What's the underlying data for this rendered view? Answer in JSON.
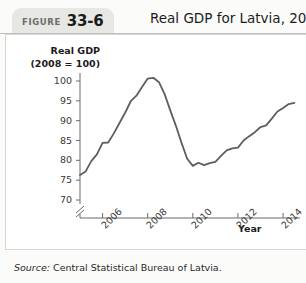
{
  "header": {
    "figure_word": "FIGURE",
    "figure_number": "33-6",
    "title": "Real GDP for Latvia, 2005–2014"
  },
  "source": {
    "label": "Source:",
    "text": "Central Statistical Bureau of Latvia."
  },
  "colors": {
    "line": "#5e5e5e",
    "axis": "#6b6b6b",
    "tab_bg": "#e7e7e4",
    "panel_bg": "#ffffff",
    "page_bg": "#fbfbfa",
    "text": "#1b1b1b"
  },
  "chart_data": {
    "type": "line",
    "title": "Real GDP for Latvia, 2005–2014",
    "xlabel": "Year",
    "ylabel": "Real GDP (2008 = 100)",
    "ylabel_lines": [
      "Real GDP",
      "(2008 = 100)"
    ],
    "ylim": [
      68,
      102
    ],
    "xlim": [
      2005.0,
      2014.75
    ],
    "yticks": [
      70,
      75,
      80,
      85,
      90,
      95,
      100
    ],
    "ytick_labels": [
      "70",
      "75",
      "80",
      "85",
      "90",
      "95",
      "100"
    ],
    "xticks": [
      2006,
      2008,
      2010,
      2012,
      2014
    ],
    "xtick_labels": [
      "2006",
      "2008",
      "2010",
      "2012",
      "2014"
    ],
    "xtick_rotation_deg": -45,
    "axis_break": true,
    "axis_break_note": "y-axis break below 70",
    "grid": false,
    "legend": null,
    "series": [
      {
        "name": "Real GDP index (2008 = 100)",
        "x": [
          2005.0,
          2005.25,
          2005.5,
          2005.75,
          2006.0,
          2006.25,
          2006.5,
          2006.75,
          2007.0,
          2007.25,
          2007.5,
          2007.75,
          2008.0,
          2008.25,
          2008.5,
          2008.75,
          2009.0,
          2009.25,
          2009.5,
          2009.75,
          2010.0,
          2010.25,
          2010.5,
          2010.75,
          2011.0,
          2011.25,
          2011.5,
          2011.75,
          2012.0,
          2012.25,
          2012.5,
          2012.75,
          2013.0,
          2013.25,
          2013.5,
          2013.75,
          2014.0,
          2014.25,
          2014.5
        ],
        "y": [
          76.3,
          77.2,
          79.8,
          81.5,
          84.4,
          84.5,
          86.8,
          89.4,
          92.0,
          94.9,
          96.3,
          98.5,
          100.6,
          100.8,
          99.7,
          96.7,
          92.6,
          88.7,
          84.4,
          80.4,
          78.6,
          79.4,
          78.8,
          79.3,
          79.6,
          81.1,
          82.5,
          83.0,
          83.2,
          85.0,
          86.1,
          87.1,
          88.4,
          88.8,
          90.5,
          92.3,
          93.2,
          94.2,
          94.5
        ]
      }
    ]
  }
}
